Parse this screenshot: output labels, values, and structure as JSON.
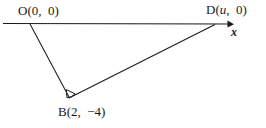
{
  "figure": {
    "type": "geometry-diagram",
    "background_color": "#ffffff",
    "stroke_color": "#1a1a1a",
    "labels": {
      "origin": "O(0,  0)",
      "point_d": "D(u,  0)",
      "point_b": "B(2,  −4)",
      "axis_x": "x"
    },
    "points": {
      "O": {
        "label": "O",
        "coords": "(0, 0)",
        "px": [
          30,
          23
        ]
      },
      "B": {
        "label": "B",
        "coords": "(2, −4)",
        "px": [
          68,
          97
        ]
      },
      "D": {
        "label": "D",
        "coords": "(u, 0)",
        "px": [
          214,
          24
        ]
      }
    },
    "axis": {
      "name": "x-axis",
      "from_px": [
        3,
        23
      ],
      "to_px": [
        233,
        24
      ],
      "arrow": "right"
    },
    "segments": [
      {
        "name": "segment-ob",
        "from": "O",
        "to": "B"
      },
      {
        "name": "segment-bd",
        "from": "B",
        "to": "D"
      }
    ],
    "right_angle_marker": {
      "at": "B",
      "size_px": 9
    }
  }
}
